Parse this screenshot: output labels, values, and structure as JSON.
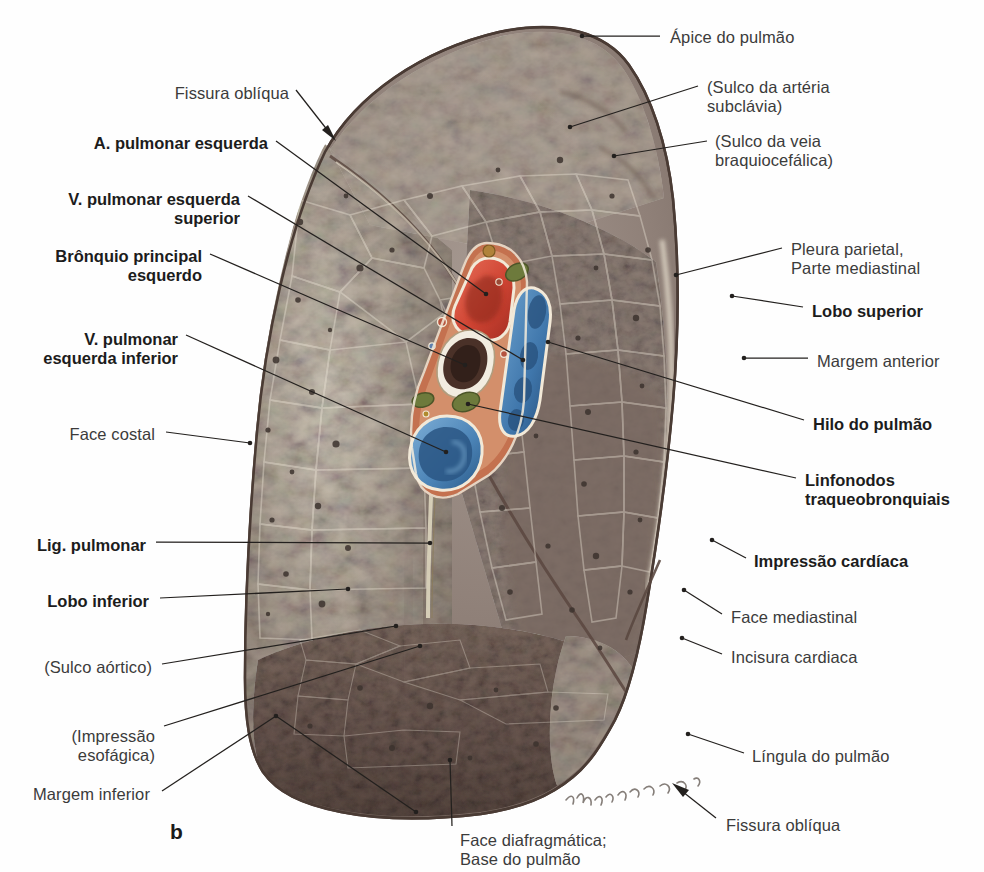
{
  "figure": {
    "panel_letter": "b",
    "signature": "Lüpperts"
  },
  "labels_left": [
    {
      "id": "fissura-obliqua-sup",
      "text": "Fissura oblíqua",
      "bold": false,
      "align": "right",
      "x": 289,
      "y": 84,
      "lines": [
        "Fissura oblíqua"
      ]
    },
    {
      "id": "a-pulmonar-esquerda",
      "text": "A. pulmonar esquerda",
      "bold": true,
      "align": "right",
      "x": 268,
      "y": 134,
      "lines": [
        "A. pulmonar esquerda"
      ]
    },
    {
      "id": "v-pulmonar-esq-superior",
      "text": "V. pulmonar esquerda superior",
      "bold": true,
      "align": "right",
      "x": 240,
      "y": 190,
      "lines": [
        "V. pulmonar esquerda",
        "superior"
      ]
    },
    {
      "id": "bronquio-principal-esquerdo",
      "text": "Brônquio principal esquerdo",
      "bold": true,
      "align": "right",
      "x": 202,
      "y": 247,
      "lines": [
        "Brônquio principal",
        "esquerdo"
      ]
    },
    {
      "id": "v-pulmonar-esq-inferior",
      "text": "V. pulmonar esquerda inferior",
      "bold": true,
      "align": "right",
      "x": 178,
      "y": 330,
      "lines": [
        "V. pulmonar",
        "esquerda inferior"
      ]
    },
    {
      "id": "face-costal",
      "text": "Face costal",
      "bold": false,
      "align": "right",
      "x": 155,
      "y": 425,
      "lines": [
        "Face costal"
      ]
    },
    {
      "id": "lig-pulmonar",
      "text": "Lig. pulmonar",
      "bold": true,
      "align": "right",
      "x": 146,
      "y": 536,
      "lines": [
        "Lig. pulmonar"
      ]
    },
    {
      "id": "lobo-inferior",
      "text": "Lobo inferior",
      "bold": true,
      "align": "right",
      "x": 149,
      "y": 592,
      "lines": [
        "Lobo inferior"
      ]
    },
    {
      "id": "sulco-aortico",
      "text": "(Sulco aórtico)",
      "bold": false,
      "align": "right",
      "x": 152,
      "y": 658,
      "lines": [
        "(Sulco aórtico)"
      ]
    },
    {
      "id": "impressao-esofagica",
      "text": "(Impressão esofágica)",
      "bold": false,
      "align": "right",
      "x": 155,
      "y": 727,
      "lines": [
        "(Impressão",
        "esofágica)"
      ]
    },
    {
      "id": "margem-inferior",
      "text": "Margem inferior",
      "bold": false,
      "align": "right",
      "x": 150,
      "y": 785,
      "lines": [
        "Margem inferior"
      ]
    }
  ],
  "labels_right": [
    {
      "id": "apice-do-pulmao",
      "text": "Ápice do pulmão",
      "bold": false,
      "align": "left",
      "x": 670,
      "y": 28,
      "lines": [
        "Ápice do pulmão"
      ]
    },
    {
      "id": "sulco-arteria-subclavia",
      "text": "(Sulco da artéria subclávia)",
      "bold": false,
      "align": "left",
      "x": 707,
      "y": 78,
      "lines": [
        "(Sulco da artéria",
        "subclávia)"
      ]
    },
    {
      "id": "sulco-veia-braquiocefalica",
      "text": "(Sulco da veia braquiocefálica)",
      "bold": false,
      "align": "left",
      "x": 715,
      "y": 132,
      "lines": [
        "(Sulco da veia",
        "braquiocefálica)"
      ]
    },
    {
      "id": "pleura-parietal-mediastinal",
      "text": "Pleura parietal, Parte mediastinal",
      "bold": false,
      "align": "left",
      "x": 791,
      "y": 240,
      "lines": [
        "Pleura parietal,",
        "Parte mediastinal"
      ]
    },
    {
      "id": "lobo-superior",
      "text": "Lobo superior",
      "bold": true,
      "align": "left",
      "x": 812,
      "y": 302,
      "lines": [
        "Lobo superior"
      ]
    },
    {
      "id": "margem-anterior",
      "text": "Margem anterior",
      "bold": false,
      "align": "left",
      "x": 817,
      "y": 352,
      "lines": [
        "Margem anterior"
      ]
    },
    {
      "id": "hilo-do-pulmao",
      "text": "Hilo do pulmão",
      "bold": true,
      "align": "left",
      "x": 813,
      "y": 415,
      "lines": [
        "Hilo do pulmão"
      ]
    },
    {
      "id": "linfonodos-traqueobronquiais",
      "text": "Linfonodos traqueobronquiais",
      "bold": true,
      "align": "left",
      "x": 805,
      "y": 471,
      "lines": [
        "Linfonodos",
        "traqueobronquiais"
      ]
    },
    {
      "id": "impressao-cardiaca",
      "text": "Impressão cardíaca",
      "bold": true,
      "align": "left",
      "x": 754,
      "y": 552,
      "lines": [
        "Impressão cardíaca"
      ]
    },
    {
      "id": "face-mediastinal",
      "text": "Face mediastinal",
      "bold": false,
      "align": "left",
      "x": 731,
      "y": 608,
      "lines": [
        "Face mediastinal"
      ]
    },
    {
      "id": "incisura-cardiaca",
      "text": "Incisura cardiaca",
      "bold": false,
      "align": "left",
      "x": 731,
      "y": 648,
      "lines": [
        "Incisura cardiaca"
      ]
    },
    {
      "id": "lingula-do-pulmao",
      "text": "Língula do pulmão",
      "bold": false,
      "align": "left",
      "x": 752,
      "y": 747,
      "lines": [
        "Língula do pulmão"
      ]
    },
    {
      "id": "fissura-obliqua-inf",
      "text": "Fissura oblíqua",
      "bold": false,
      "align": "left",
      "x": 726,
      "y": 816,
      "lines": [
        "Fissura oblíqua"
      ]
    }
  ],
  "labels_bottom": [
    {
      "id": "face-diafragmatica",
      "text": "Face diafragmática; Base do pulmão",
      "bold": false,
      "align": "left",
      "x": 460,
      "y": 831,
      "lines": [
        "Face diafragmática;",
        "Base do pulmão"
      ]
    }
  ],
  "colors": {
    "artery": "#d4503c",
    "vein": "#4f87b8",
    "bronchus": "#5a3a32",
    "lymph_node": "#6d7a3c",
    "connective": "#c4714f",
    "lung_light": "#b6ada0",
    "lung_mid": "#9a8e84",
    "lung_dark": "#6f6058",
    "lung_edge": "#5a4840",
    "leader": "#23201e",
    "text": "#3b3b3b",
    "text_bold": "#1c1c1c",
    "background": "#ffffff"
  }
}
